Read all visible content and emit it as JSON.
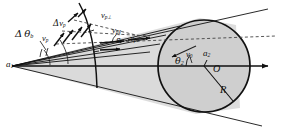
{
  "figure": {
    "kind": "geometric-vector-diagram",
    "width": 282,
    "height": 133,
    "background": "#ffffff",
    "ink": "#111111",
    "cone_fill": "#d8d8d8",
    "circle_fill": "#d0d0d0",
    "dash_color": "#444444"
  },
  "labels": {
    "apex": {
      "base": "a",
      "sub": "1"
    },
    "delta_theta": {
      "greek_delta": "Δ",
      "greek_theta": "θ",
      "sub": "b"
    },
    "delta_v_upper": {
      "greek_delta": "Δ",
      "base": "v",
      "sub": "p"
    },
    "delta_v_lower": {
      "greek_delta": "Δ",
      "base": "v",
      "sub": "p"
    },
    "v_p_top": {
      "base": "v",
      "sub": "p⊥"
    },
    "v_p_mid": {
      "base": "v",
      "sub": "p∥"
    },
    "v_p_right": {
      "base": "v",
      "sub": "p0"
    },
    "epsilon": {
      "greek": "ε"
    },
    "theta2": {
      "greek_theta": "θ",
      "sub": "2"
    },
    "v_circle": {
      "base": "v",
      "sub": "0"
    },
    "a2": {
      "base": "a",
      "sub": "2"
    },
    "center": {
      "base": "O"
    },
    "radius": {
      "base": "R"
    }
  },
  "annotations": [
    {
      "name": "apex-label",
      "text": "a₁",
      "x": 9,
      "y": 63
    },
    {
      "name": "delta-theta-label",
      "text": "Δ θ_b",
      "x": 18,
      "y": 34
    },
    {
      "name": "delta-v-label-1",
      "text": "Δv_p",
      "x": 57,
      "y": 24
    },
    {
      "name": "delta-v-label-2",
      "text": "v_p",
      "x": 47,
      "y": 39
    },
    {
      "name": "v-perp-label",
      "text": "v_{p⊥}",
      "x": 104,
      "y": 16
    },
    {
      "name": "v-par-label",
      "text": "v_{p∥}",
      "x": 117,
      "y": 30
    },
    {
      "name": "v-p0-label",
      "text": "v_{p0}",
      "x": 134,
      "y": 39
    },
    {
      "name": "epsilon-label",
      "text": "ε",
      "x": 119,
      "y": 42
    },
    {
      "name": "theta2-label",
      "text": "θ₂",
      "x": 177,
      "y": 58
    },
    {
      "name": "v0-label",
      "text": "v₀",
      "x": 187,
      "y": 53
    },
    {
      "name": "a2-label",
      "text": "a₂",
      "x": 204,
      "y": 52
    },
    {
      "name": "center-label",
      "text": "O",
      "x": 215,
      "y": 67
    },
    {
      "name": "radius-label",
      "text": "R",
      "x": 221,
      "y": 88
    }
  ],
  "geometry": {
    "apex": {
      "x": 12,
      "y": 66
    },
    "circle": {
      "cx": 204,
      "cy": 66,
      "r": 46
    },
    "axis": {
      "x1": 12,
      "y1": 66,
      "x2": 272,
      "y2": 66
    },
    "radius_line": {
      "x1": 204,
      "y1": 66,
      "x2": 233,
      "y2": 101
    }
  }
}
